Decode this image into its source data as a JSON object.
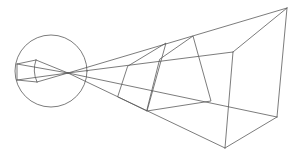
{
  "diagram": {
    "type": "perspective-projection-line-drawing",
    "stroke_color": "#5a5a5a",
    "background": "#ffffff",
    "focal_point": [
      68,
      73
    ],
    "lens_circle": {
      "cx": 51,
      "cy": 71,
      "r": 36
    },
    "small_object": {
      "points": [
        [
          17,
          64
        ],
        [
          36,
          60
        ],
        [
          37,
          82
        ],
        [
          17,
          80
        ]
      ],
      "curved_right_edge": "M36,60 Q32,71 37,82"
    },
    "frames": [
      {
        "name": "frame-1",
        "points": [
          [
            128,
            66
          ],
          [
            166,
            43
          ],
          [
            147,
            111
          ],
          [
            118,
            97
          ]
        ]
      },
      {
        "name": "frame-2",
        "points": [
          [
            160,
            59
          ],
          [
            193,
            36
          ],
          [
            211,
            101
          ],
          [
            147,
            111
          ]
        ]
      }
    ],
    "big_box": {
      "far_top": [
        287,
        8
      ],
      "far_bottom": [
        277,
        117
      ],
      "near_top": [
        233,
        52
      ],
      "near_bottom": [
        225,
        148
      ]
    },
    "rays": [
      [
        [
          36,
          60
        ],
        [
          68,
          73
        ]
      ],
      [
        [
          37,
          82
        ],
        [
          68,
          73
        ]
      ],
      [
        [
          17,
          64
        ],
        [
          68,
          73
        ]
      ],
      [
        [
          17,
          80
        ],
        [
          68,
          73
        ]
      ],
      [
        [
          68,
          73
        ],
        [
          287,
          8
        ]
      ],
      [
        [
          68,
          73
        ],
        [
          233,
          52
        ]
      ],
      [
        [
          68,
          73
        ],
        [
          277,
          117
        ]
      ],
      [
        [
          68,
          73
        ],
        [
          225,
          148
        ]
      ]
    ]
  }
}
